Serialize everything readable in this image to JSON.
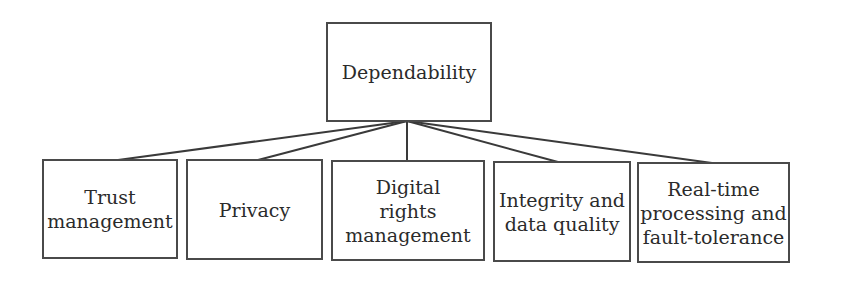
{
  "diagram": {
    "type": "hierarchy",
    "root": {
      "label": "Dependability"
    },
    "children": [
      {
        "label": "Trust\nmanagement"
      },
      {
        "label": "Privacy"
      },
      {
        "label": "Digital\nrights\nmanagement"
      },
      {
        "label": "Integrity and\ndata quality"
      },
      {
        "label": "Real-time\nprocessing and\nfault-tolerance"
      }
    ],
    "colors": {
      "border": "#4a4a4a",
      "text": "#2b2b2b",
      "background": "#ffffff"
    }
  }
}
